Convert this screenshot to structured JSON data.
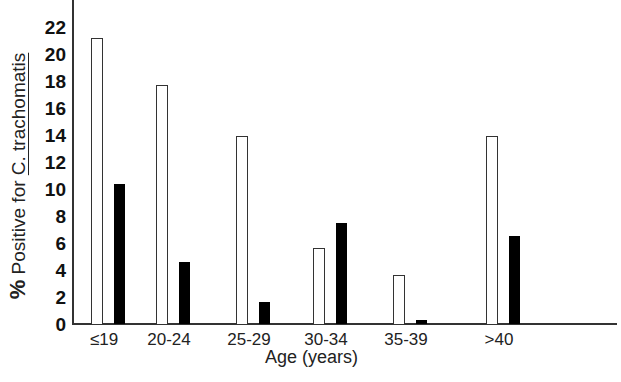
{
  "chart_data": {
    "type": "bar",
    "title": "",
    "xlabel": "Age (years)",
    "ylabel": {
      "prefix": "%",
      "text": " Positive for ",
      "organism": "C. trachomatis"
    },
    "categories": [
      "≤19",
      "20-24",
      "25-29",
      "30-34",
      "35-39",
      ">40"
    ],
    "series": [
      {
        "name": "open bars",
        "style": "open",
        "values": [
          21.2,
          17.7,
          13.9,
          5.6,
          3.6,
          13.9
        ]
      },
      {
        "name": "filled bars",
        "style": "filled",
        "values": [
          10.4,
          4.6,
          1.6,
          7.5,
          0.3,
          6.5
        ]
      }
    ],
    "yticks": [
      "0",
      "2",
      "4",
      "6",
      "8",
      "10",
      "12",
      "14",
      "16",
      "18",
      "20",
      "22"
    ],
    "ylim": [
      0,
      22
    ],
    "grid": false,
    "legend": "none"
  }
}
